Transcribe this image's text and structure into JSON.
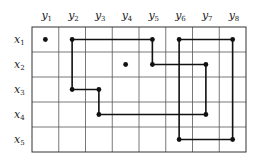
{
  "diagram": {
    "grid": {
      "left": 32,
      "top": 27,
      "right": 246,
      "bottom": 152,
      "cols": 8,
      "rows": 5
    },
    "column_labels": [
      {
        "base": "y",
        "sub": "1"
      },
      {
        "base": "y",
        "sub": "2"
      },
      {
        "base": "y",
        "sub": "3"
      },
      {
        "base": "y",
        "sub": "4"
      },
      {
        "base": "y",
        "sub": "5"
      },
      {
        "base": "y",
        "sub": "6"
      },
      {
        "base": "y",
        "sub": "7"
      },
      {
        "base": "y",
        "sub": "8"
      }
    ],
    "row_labels": [
      {
        "base": "x",
        "sub": "1"
      },
      {
        "base": "x",
        "sub": "2"
      },
      {
        "base": "x",
        "sub": "3"
      },
      {
        "base": "x",
        "sub": "4"
      },
      {
        "base": "x",
        "sub": "5"
      }
    ],
    "dots": [
      {
        "row": 1,
        "col": 1
      },
      {
        "row": 1,
        "col": 2
      },
      {
        "row": 1,
        "col": 5
      },
      {
        "row": 1,
        "col": 6
      },
      {
        "row": 1,
        "col": 8
      },
      {
        "row": 2,
        "col": 4
      },
      {
        "row": 2,
        "col": 5
      },
      {
        "row": 2,
        "col": 7
      },
      {
        "row": 3,
        "col": 2
      },
      {
        "row": 3,
        "col": 3
      },
      {
        "row": 4,
        "col": 3
      },
      {
        "row": 4,
        "col": 7
      },
      {
        "row": 5,
        "col": 6
      },
      {
        "row": 5,
        "col": 8
      }
    ],
    "cycles": [
      {
        "name": "cycle-1",
        "vertices": [
          [
            1,
            2
          ],
          [
            1,
            5
          ],
          [
            2,
            5
          ],
          [
            2,
            7
          ],
          [
            4,
            7
          ],
          [
            4,
            3
          ],
          [
            3,
            3
          ],
          [
            3,
            2
          ]
        ]
      },
      {
        "name": "cycle-2",
        "vertices": [
          [
            1,
            6
          ],
          [
            1,
            8
          ],
          [
            5,
            8
          ],
          [
            5,
            6
          ]
        ]
      }
    ],
    "colors": {
      "line": "#111111",
      "grid": "#555555"
    }
  }
}
